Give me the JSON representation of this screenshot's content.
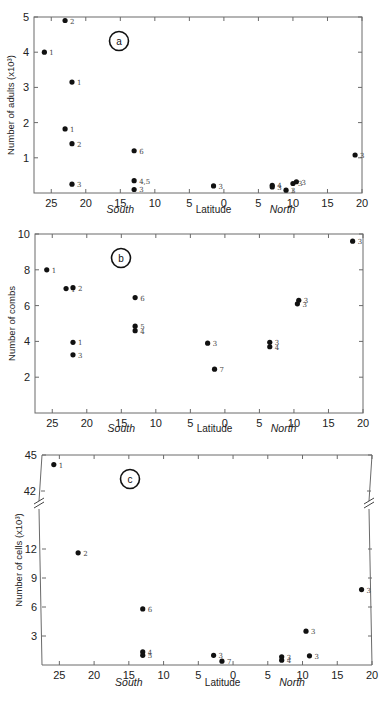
{
  "chart_data": [
    {
      "type": "scatter",
      "panel": "a",
      "title": "",
      "xlabel": "Latitude",
      "x_hemisphere_labels": {
        "south": "South",
        "north": "North"
      },
      "ylabel": "Number of adults (x10³)",
      "x_ticks": [
        25,
        20,
        15,
        10,
        5,
        0,
        5,
        10,
        15,
        20
      ],
      "x_tick_values": [
        -25,
        -20,
        -15,
        -10,
        -5,
        0,
        5,
        10,
        15,
        20
      ],
      "y_ticks": [
        1,
        2,
        3,
        4,
        5
      ],
      "xlim": [
        -27.5,
        20
      ],
      "ylim": [
        0,
        5
      ],
      "grid": false,
      "points": [
        {
          "lat": -26,
          "value": 4.0,
          "label": "1"
        },
        {
          "lat": -23,
          "value": 4.9,
          "label": "2"
        },
        {
          "lat": -22,
          "value": 3.15,
          "label": "1"
        },
        {
          "lat": -23,
          "value": 1.82,
          "label": "1"
        },
        {
          "lat": -22,
          "value": 1.4,
          "label": "2"
        },
        {
          "lat": -22,
          "value": 0.25,
          "label": "3"
        },
        {
          "lat": -13,
          "value": 1.2,
          "label": "6"
        },
        {
          "lat": -13,
          "value": 0.35,
          "label": "4,5"
        },
        {
          "lat": -13,
          "value": 0.1,
          "label": "3"
        },
        {
          "lat": -1.5,
          "value": 0.2,
          "label": "3"
        },
        {
          "lat": 7,
          "value": 0.22,
          "label": "4"
        },
        {
          "lat": 7,
          "value": 0.17,
          "label": "3"
        },
        {
          "lat": 9,
          "value": 0.08,
          "label": "3"
        },
        {
          "lat": 10,
          "value": 0.27,
          "label": "3"
        },
        {
          "lat": 10.5,
          "value": 0.32,
          "label": "3"
        },
        {
          "lat": 19,
          "value": 1.08,
          "label": "3"
        }
      ]
    },
    {
      "type": "scatter",
      "panel": "b",
      "title": "",
      "xlabel": "Latitude",
      "x_hemisphere_labels": {
        "south": "South",
        "north": "North"
      },
      "ylabel": "Number of combs",
      "x_ticks": [
        25,
        20,
        15,
        10,
        5,
        0,
        5,
        10,
        15,
        20
      ],
      "x_tick_values": [
        -25,
        -20,
        -15,
        -10,
        -5,
        0,
        5,
        10,
        15,
        20
      ],
      "y_ticks": [
        2,
        4,
        6,
        8,
        10
      ],
      "xlim": [
        -27.5,
        20
      ],
      "ylim": [
        0,
        10
      ],
      "grid": false,
      "points": [
        {
          "lat": -25.8,
          "value": 8.0,
          "label": "1"
        },
        {
          "lat": -23,
          "value": 6.95,
          "label": "1"
        },
        {
          "lat": -22,
          "value": 7.0,
          "label": "2"
        },
        {
          "lat": -22,
          "value": 3.95,
          "label": "1"
        },
        {
          "lat": -22,
          "value": 3.25,
          "label": "3"
        },
        {
          "lat": -13,
          "value": 6.45,
          "label": "6"
        },
        {
          "lat": -13,
          "value": 4.85,
          "label": "5"
        },
        {
          "lat": -13,
          "value": 4.6,
          "label": "4"
        },
        {
          "lat": -2.5,
          "value": 3.9,
          "label": "3"
        },
        {
          "lat": -1.5,
          "value": 2.45,
          "label": "7"
        },
        {
          "lat": 6.5,
          "value": 3.95,
          "label": "3"
        },
        {
          "lat": 6.5,
          "value": 3.7,
          "label": "4"
        },
        {
          "lat": 10.5,
          "value": 6.1,
          "label": "3"
        },
        {
          "lat": 10.7,
          "value": 6.3,
          "label": "3"
        },
        {
          "lat": 18.5,
          "value": 9.6,
          "label": "3"
        }
      ]
    },
    {
      "type": "scatter",
      "panel": "c",
      "title": "",
      "xlabel": "Latitude",
      "x_hemisphere_labels": {
        "south": "South",
        "north": "North"
      },
      "ylabel": "Number of cells (x10³)",
      "x_ticks": [
        25,
        20,
        15,
        10,
        5,
        0,
        5,
        10,
        15,
        20
      ],
      "x_tick_values": [
        -25,
        -20,
        -15,
        -10,
        -5,
        0,
        5,
        10,
        15,
        20
      ],
      "y_ticks": [
        3,
        6,
        9,
        12,
        42,
        45
      ],
      "y_axis_break": {
        "between": [
          12,
          42
        ]
      },
      "xlim": [
        -27.5,
        20
      ],
      "ylim": [
        0,
        45
      ],
      "grid": false,
      "points": [
        {
          "lat": -25.8,
          "value": 44.2,
          "label": "1"
        },
        {
          "lat": -22.3,
          "value": 11.6,
          "label": "2"
        },
        {
          "lat": -13,
          "value": 5.8,
          "label": "6"
        },
        {
          "lat": -13,
          "value": 1.35,
          "label": "4"
        },
        {
          "lat": -13,
          "value": 1.0,
          "label": "5"
        },
        {
          "lat": -2.8,
          "value": 1.0,
          "label": "3"
        },
        {
          "lat": -1.6,
          "value": 0.4,
          "label": "7"
        },
        {
          "lat": 7,
          "value": 0.85,
          "label": "3"
        },
        {
          "lat": 7,
          "value": 0.5,
          "label": "4"
        },
        {
          "lat": 10.5,
          "value": 3.5,
          "label": "3"
        },
        {
          "lat": 11,
          "value": 0.95,
          "label": "3"
        },
        {
          "lat": 18.5,
          "value": 7.8,
          "label": "3"
        }
      ]
    }
  ]
}
